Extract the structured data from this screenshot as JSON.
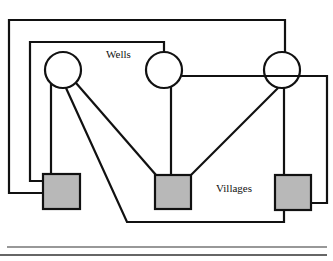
{
  "diagram": {
    "labels": {
      "wells": "Wells",
      "villages": "Villages"
    },
    "colors": {
      "line": "#111111",
      "box_fill": "#b8b8b8",
      "background": "#ffffff"
    },
    "wells": [
      {
        "id": "well-1",
        "cx": 63,
        "cy": 70,
        "r": 18
      },
      {
        "id": "well-2",
        "cx": 164,
        "cy": 70,
        "r": 18
      },
      {
        "id": "well-3",
        "cx": 282,
        "cy": 70,
        "r": 18
      }
    ],
    "villages": [
      {
        "id": "village-1",
        "x": 43,
        "y": 174,
        "w": 37,
        "h": 35
      },
      {
        "id": "village-2",
        "x": 155,
        "y": 175,
        "w": 36,
        "h": 34
      },
      {
        "id": "village-3",
        "x": 275,
        "y": 175,
        "w": 36,
        "h": 35
      }
    ]
  }
}
